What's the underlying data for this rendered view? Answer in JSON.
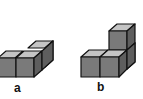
{
  "figures": [
    {
      "id": "a",
      "label": "a",
      "description": "L-shaped arrangement of 3 cubes: two in front row, one behind the right cube"
    },
    {
      "id": "b",
      "label": "b",
      "description": "Arrangement of cubes: two in front row, a stacked column of cubes behind/above on the right"
    }
  ],
  "colors": {
    "front_face": "#7a7a7a",
    "top_face": "#c4c4c4",
    "side_face": "#5e5e5e",
    "edge": "#111111",
    "background": "#ffffff"
  }
}
